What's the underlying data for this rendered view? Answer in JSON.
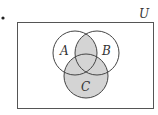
{
  "diagram": {
    "type": "venn",
    "universe_label": "U",
    "sets": [
      {
        "label": "A"
      },
      {
        "label": "B"
      },
      {
        "label": "C"
      }
    ],
    "shaded_region": "(A ∩ B) ∪ C",
    "colors": {
      "shade": "#d4d4d4",
      "stroke": "#444444",
      "background": "#ffffff"
    }
  },
  "bullet": "•"
}
